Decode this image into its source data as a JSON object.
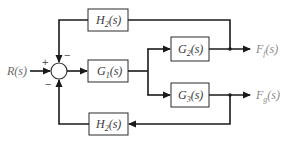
{
  "diagram": {
    "type": "block-diagram",
    "input": {
      "label": "R(s)",
      "main": "R",
      "arg": "(s)"
    },
    "summing_junction": {
      "signs": {
        "input": "+",
        "top_feedback": "−",
        "bottom_feedback": "−"
      }
    },
    "blocks": [
      {
        "id": "H2_top",
        "main": "H",
        "sub": "2",
        "arg": "(s)",
        "label": "H2(s)"
      },
      {
        "id": "G1",
        "main": "G",
        "sub": "1",
        "arg": "(s)",
        "label": "G1(s)"
      },
      {
        "id": "G2",
        "main": "G",
        "sub": "2",
        "arg": "(s)",
        "label": "G2(s)"
      },
      {
        "id": "G3",
        "main": "G",
        "sub": "3",
        "arg": "(s)",
        "label": "G3(s)"
      },
      {
        "id": "H2_bottom",
        "main": "H",
        "sub": "2",
        "arg": "(s)",
        "label": "H2(s)"
      }
    ],
    "outputs": [
      {
        "id": "Ff",
        "main": "F",
        "sub": "f",
        "arg": "(s)",
        "label": "Ff(s)"
      },
      {
        "id": "Fg",
        "main": "F",
        "sub": "g",
        "arg": "(s)",
        "label": "Fg(s)"
      }
    ],
    "connections": [
      "R(s) -> sum(+)",
      "sum -> G1(s)",
      "G1(s) -> G2(s)",
      "G1(s) -> G3(s)",
      "G2(s) -> Ff(s)",
      "G3(s) -> Fg(s)",
      "Ff(s) -> H2(s) top -> sum(−)",
      "Fg(s) -> H2(s) bottom -> sum(−)"
    ],
    "colors": {
      "line": "#1a1a1a",
      "block_border": "#2a2a2a",
      "output_label": "#8a8a8a"
    }
  }
}
